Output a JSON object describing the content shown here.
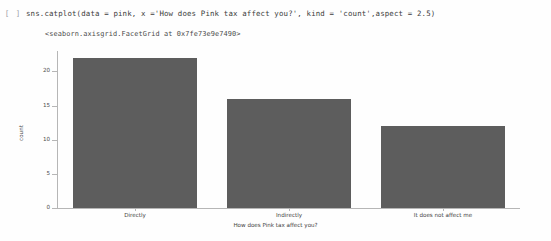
{
  "cell": {
    "run_marker": "[ ]",
    "code": "sns.catplot(data = pink, x ='How does Pink tax affect you?', kind = 'count',aspect = 2.5)",
    "repr_output": "<seaborn.axisgrid.FacetGrid at 0x7fe73e9e7490>"
  },
  "colors": {
    "bar": "#5d5d5d",
    "axis": "#b6b6b6",
    "text": "#3f3f3f",
    "background": "#fefefe"
  },
  "chart_data": {
    "type": "bar",
    "title": "",
    "xlabel": "How does Pink tax affect you?",
    "ylabel": "count",
    "categories": [
      "Directly",
      "Indirectly",
      "It does not affect me"
    ],
    "values": [
      22,
      16,
      12
    ],
    "ylim": [
      0,
      23
    ],
    "yticks": [
      0,
      5,
      10,
      15,
      20
    ],
    "ytick_labels": [
      "0",
      "5",
      "10",
      "15",
      "20"
    ],
    "grid": false,
    "legend": null
  }
}
